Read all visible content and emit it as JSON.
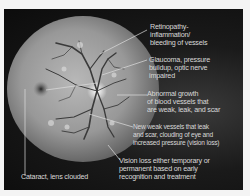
{
  "diagram": {
    "labels": [
      {
        "id": "retinopathy",
        "lines": [
          "Retinopathy-",
          "inflammation/",
          "bleeding of vessels"
        ]
      },
      {
        "id": "glaucoma",
        "lines": [
          "Glaucoma, pressure",
          "buildup, optic nerve",
          "impaired"
        ]
      },
      {
        "id": "abnormal-growth",
        "lines": [
          "Abnormal growth",
          "of blood vessels that",
          "are weak, leak, and scar"
        ]
      },
      {
        "id": "new-weak-vessels",
        "lines": [
          "New weak vessels that leak",
          "and scar, clouding of eye and",
          "increased pressure (vision loss)"
        ]
      },
      {
        "id": "vision-loss",
        "lines": [
          "Vision loss either temporary or",
          "permanent based on early",
          "recognition and treatment"
        ]
      },
      {
        "id": "cataract",
        "lines": [
          "Cataract, lens clouded"
        ]
      }
    ]
  }
}
